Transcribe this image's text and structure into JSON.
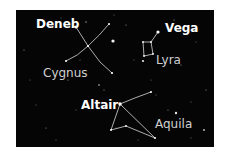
{
  "chart": {
    "background": "#050505",
    "line_color": "#d8d8d8",
    "star_color": "#ffffff"
  },
  "labels": {
    "deneb": "Deneb",
    "vega": "Vega",
    "altair": "Altair",
    "cygnus": "Cygnus",
    "lyra": "Lyra",
    "aquila": "Aquila"
  },
  "constellations": [
    {
      "name": "Cygnus",
      "bright_star": "Deneb"
    },
    {
      "name": "Lyra",
      "bright_star": "Vega"
    },
    {
      "name": "Aquila",
      "bright_star": "Altair"
    }
  ]
}
